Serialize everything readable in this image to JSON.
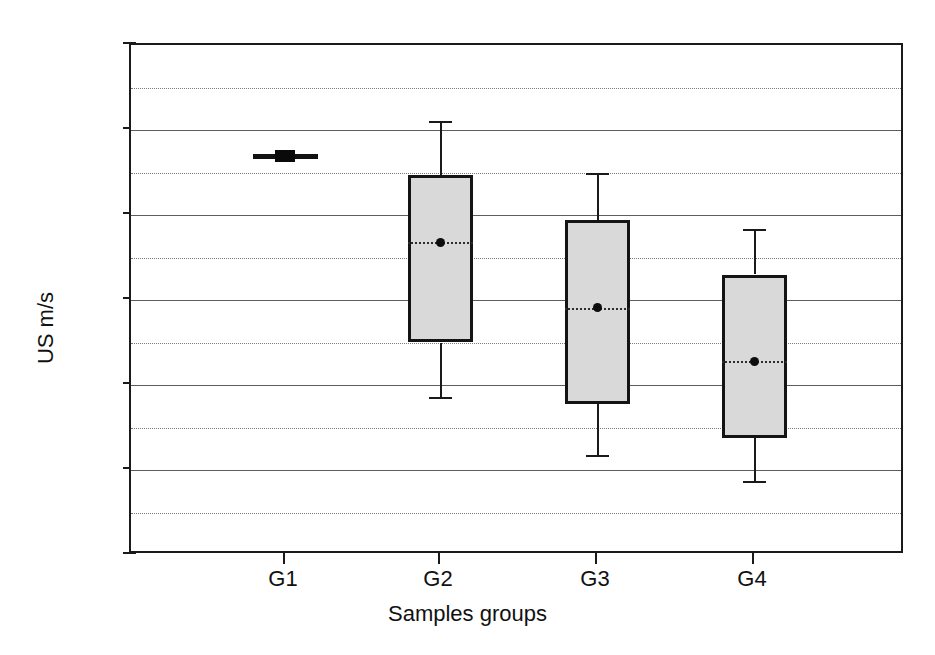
{
  "chart_data": {
    "type": "box",
    "title": "",
    "xlabel": "Samples groups",
    "ylabel": "US m/s",
    "categories": [
      "G1",
      "G2",
      "G3",
      "G4"
    ],
    "ylim": [
      1000,
      7000
    ],
    "y_major_ticks": [
      1000,
      2000,
      3000,
      4000,
      5000,
      6000,
      7000
    ],
    "y_minor_gridlines": [
      1500,
      2500,
      3500,
      4500,
      5500,
      6500
    ],
    "y_tick_labels": [
      "1000",
      "2000",
      "3000",
      "4000",
      "5000",
      "6000",
      "7000"
    ],
    "grid": "major solid, minor dotted",
    "legend": "none",
    "boxes": [
      {
        "category": "G1",
        "whisker_low": 5690,
        "q1": 5680,
        "median": 5690,
        "mean": 5690,
        "q3": 5700,
        "whisker_high": 5690,
        "collapsed": true
      },
      {
        "category": "G2",
        "whisker_low": 2860,
        "q1": 3500,
        "median": 4680,
        "mean": 4680,
        "q3": 5470,
        "whisker_high": 6110,
        "collapsed": false
      },
      {
        "category": "G3",
        "whisker_low": 2180,
        "q1": 2780,
        "median": 3910,
        "mean": 3910,
        "q3": 4940,
        "whisker_high": 5500,
        "collapsed": false
      },
      {
        "category": "G4",
        "whisker_low": 1870,
        "q1": 2380,
        "median": 3280,
        "mean": 3280,
        "q3": 4300,
        "whisker_high": 4830,
        "collapsed": false
      }
    ]
  },
  "axis": {
    "y_title": "US m/s",
    "x_title": "Samples groups"
  },
  "colors": {
    "box_fill": "#d9d9d9",
    "box_stroke": "#141414",
    "grid_major": "#5d5d5d",
    "grid_minor": "#7a7a7a",
    "axis": "#1a1a1a",
    "text": "#111111"
  }
}
